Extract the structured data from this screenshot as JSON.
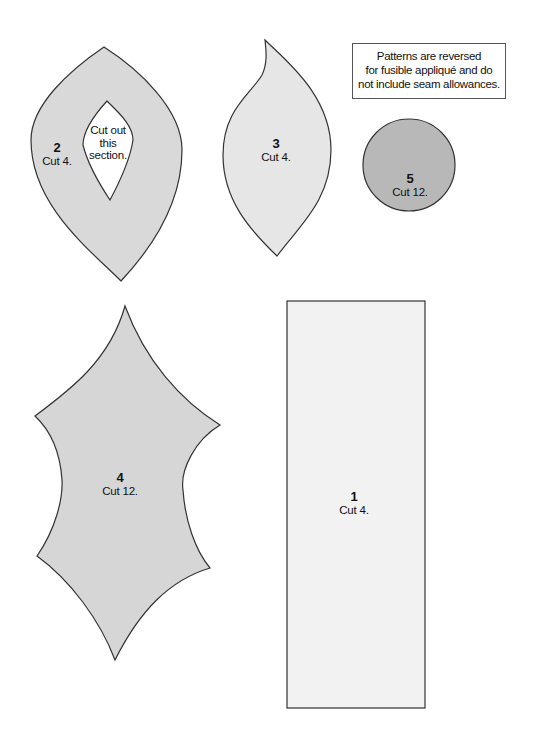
{
  "note": {
    "text_line1": "Patterns are reversed",
    "text_line2": "for fusible appliqué and do",
    "text_line3": "not include seam allowances."
  },
  "pieces": [
    {
      "number": "1",
      "instruction": "Cut 4.",
      "shape": "rectangle",
      "fill": "#f2f2f2"
    },
    {
      "number": "2",
      "instruction": "Cut 4.",
      "shape": "leaf-with-cutout",
      "fill": "#d9d9d9",
      "cutout_text": [
        "Cut out",
        "this",
        "section."
      ]
    },
    {
      "number": "3",
      "instruction": "Cut 4.",
      "shape": "curved-leaf",
      "fill": "#e6e6e6"
    },
    {
      "number": "4",
      "instruction": "Cut 12.",
      "shape": "holly-leaf",
      "fill": "#d6d6d6"
    },
    {
      "number": "5",
      "instruction": "Cut 12.",
      "shape": "circle",
      "fill": "#b8b8b8"
    }
  ],
  "colors": {
    "outline": "#333333",
    "background": "#ffffff"
  }
}
